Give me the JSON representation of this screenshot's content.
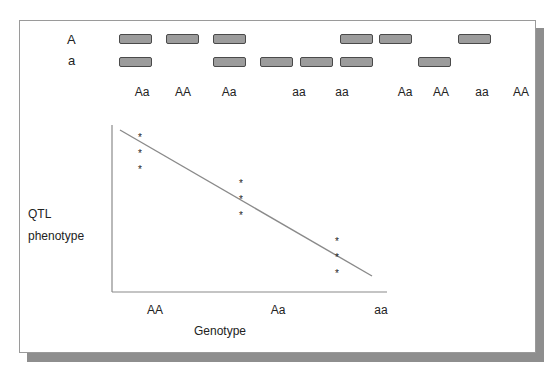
{
  "gel": {
    "row_labels": {
      "upper": "A",
      "lower": "a"
    },
    "bands": [
      {
        "row": "A",
        "x": 119
      },
      {
        "row": "a",
        "x": 119
      },
      {
        "row": "A",
        "x": 166
      },
      {
        "row": "A",
        "x": 213
      },
      {
        "row": "a",
        "x": 213
      },
      {
        "row": "a",
        "x": 260
      },
      {
        "row": "a",
        "x": 300
      },
      {
        "row": "A",
        "x": 340
      },
      {
        "row": "a",
        "x": 340
      },
      {
        "row": "A",
        "x": 379
      },
      {
        "row": "a",
        "x": 418
      },
      {
        "row": "A",
        "x": 458
      }
    ],
    "lane_labels": [
      {
        "text": "Aa",
        "x": 142
      },
      {
        "text": "AA",
        "x": 183
      },
      {
        "text": "Aa",
        "x": 229
      },
      {
        "text": "aa",
        "x": 299
      },
      {
        "text": "aa",
        "x": 342
      },
      {
        "text": "Aa",
        "x": 405
      },
      {
        "text": "AA",
        "x": 441
      },
      {
        "text": "aa",
        "x": 482
      },
      {
        "text": "AA",
        "x": 521
      }
    ]
  },
  "plot": {
    "ylabel_line1": "QTL",
    "ylabel_line2": "phenotype",
    "xlabel": "Genotype",
    "x_ticks": [
      {
        "text": "AA",
        "x": 155
      },
      {
        "text": "Aa",
        "x": 278
      },
      {
        "text": "aa",
        "x": 381
      }
    ],
    "star_glyph": "*",
    "points": [
      {
        "genotype": "AA",
        "x": 140,
        "y": 136
      },
      {
        "genotype": "AA",
        "x": 140,
        "y": 152
      },
      {
        "genotype": "AA",
        "x": 140,
        "y": 168
      },
      {
        "genotype": "Aa",
        "x": 241,
        "y": 182
      },
      {
        "genotype": "Aa",
        "x": 241,
        "y": 198
      },
      {
        "genotype": "Aa",
        "x": 241,
        "y": 214
      },
      {
        "genotype": "aa",
        "x": 337,
        "y": 240
      },
      {
        "genotype": "aa",
        "x": 337,
        "y": 256
      },
      {
        "genotype": "aa",
        "x": 337,
        "y": 272
      }
    ],
    "regression_line": {
      "x1": 120,
      "y1": 130,
      "x2": 372,
      "y2": 276
    },
    "colors": {
      "line": "#8a8a8a",
      "axis": "#8a8a8a",
      "band_fill": "#9c9c9c",
      "band_border": "#4a4a4a",
      "shadow": "#8e8e8e"
    }
  }
}
